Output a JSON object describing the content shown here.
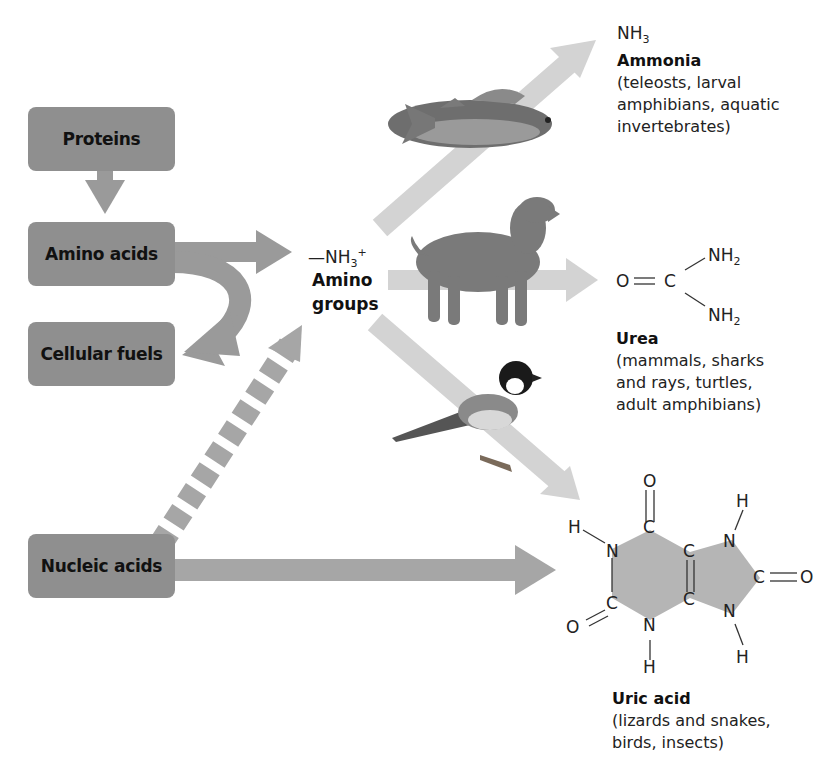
{
  "sources": {
    "proteins": "Proteins",
    "amino_acids": "Amino acids",
    "cellular_fuels": "Cellular fuels",
    "nucleic_acids": "Nucleic acids"
  },
  "amino_group": {
    "formula_prefix": "—NH",
    "formula_sub": "3",
    "formula_sup": "+",
    "label_line1": "Amino",
    "label_line2": "groups"
  },
  "ammonia": {
    "formula": "NH",
    "formula_sub": "3",
    "name": "Ammonia",
    "organisms": [
      "(teleosts, larval",
      "amphibians, aquatic",
      "invertebrates)"
    ]
  },
  "urea": {
    "atom_O": "O",
    "atom_C": "C",
    "nh2_top": "NH",
    "nh2_bottom": "NH",
    "sub": "2",
    "name": "Urea",
    "organisms": [
      "(mammals, sharks",
      "and rays, turtles,",
      "adult amphibians)"
    ]
  },
  "uric_acid": {
    "name": "Uric acid",
    "organisms": [
      "(lizards and snakes,",
      "birds, insects)"
    ],
    "atoms": {
      "O": "O",
      "C": "C",
      "N": "N",
      "H": "H"
    }
  },
  "illustrations": {
    "fish": "fish-illustration",
    "dog": "dog-illustration",
    "bird": "bird-illustration"
  },
  "colors": {
    "box": "#8f8f8f",
    "dark_arrow": "#9a9a9a",
    "light_arrow": "#d0d0d0",
    "ring_fill": "#b5b5b5"
  }
}
